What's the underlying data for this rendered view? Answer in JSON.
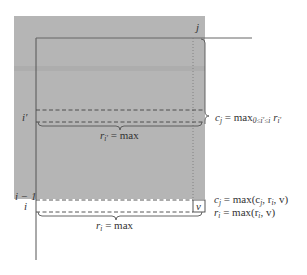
{
  "diagram": {
    "type": "matrix-dp-illustration",
    "colors": {
      "shade": "#b5b5b5",
      "line": "#555555",
      "text": "#333333",
      "background": "#ffffff"
    },
    "labels": {
      "column_j": "j",
      "row_i_prime": "i′",
      "row_i_minus_1": "i − 1",
      "row_i": "i",
      "cell_v": "v"
    },
    "annotations": {
      "col_max": {
        "lhs": "c",
        "lhs_sub": "j",
        "eq": " = max",
        "range_sub": "0≤i′≤i",
        "rhs": " r",
        "rhs_sub": "i′"
      },
      "row_i_prime_max": {
        "lhs": "r",
        "lhs_sub": "i′",
        "rhs": " = max"
      },
      "update_c": {
        "lhs": "c",
        "lhs_sub": "j",
        "rhs": " = max(c",
        "a_sub": "j",
        "mid": ", r",
        "b_sub": "i",
        "tail": ", v)"
      },
      "update_r": {
        "lhs": "r",
        "lhs_sub": "i",
        "rhs": " = max(r",
        "a_sub": "i",
        "tail": ", v)"
      },
      "row_i_max": {
        "lhs": "r",
        "lhs_sub": "i",
        "rhs": " = max"
      }
    }
  }
}
